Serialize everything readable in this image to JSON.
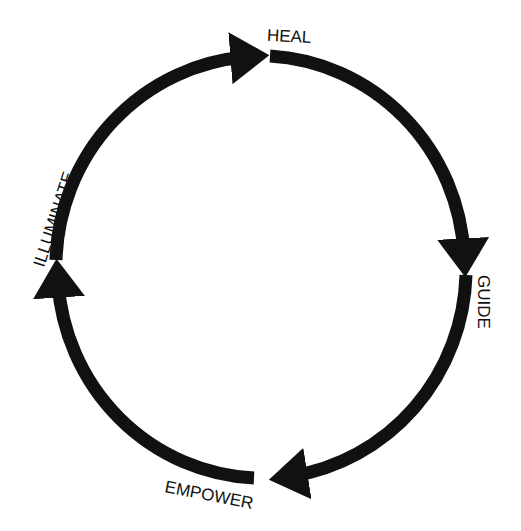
{
  "diagram": {
    "type": "cycle",
    "direction": "clockwise",
    "stroke_color": "#111111",
    "background": "#ffffff",
    "nodes": [
      {
        "id": "heal",
        "label": "HEAL"
      },
      {
        "id": "guide",
        "label": "GUIDE"
      },
      {
        "id": "empower",
        "label": "EMPOWER"
      },
      {
        "id": "illuminate",
        "label": "ILLUMINATE"
      }
    ],
    "edges": [
      {
        "from": "heal",
        "to": "guide"
      },
      {
        "from": "guide",
        "to": "empower"
      },
      {
        "from": "empower",
        "to": "illuminate"
      },
      {
        "from": "illuminate",
        "to": "heal"
      }
    ]
  }
}
